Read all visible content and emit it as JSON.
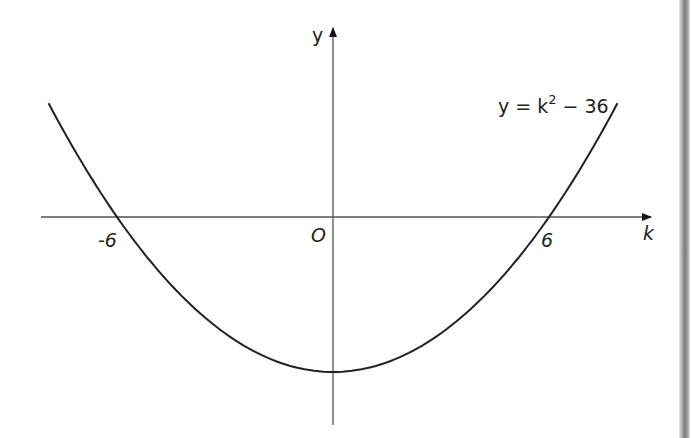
{
  "chart_data": {
    "type": "line",
    "title": "",
    "equation_label": "y = k² − 36",
    "equation_parts": {
      "lhs": "y = k",
      "exp": "2",
      "rhs": " − 36"
    },
    "xlabel": "k",
    "ylabel": "y",
    "origin_label": "O",
    "x_tick_labels": [
      "-6",
      "6"
    ],
    "x_ticks": [
      -6,
      6
    ],
    "vertex": {
      "x": 0,
      "y": -36
    },
    "roots": [
      -6,
      6
    ],
    "xlim": [
      -8.1,
      8.7
    ],
    "ylim": [
      -48,
      44
    ],
    "grid": false,
    "legend": "none",
    "series": [
      {
        "name": "y = k^2 - 36",
        "x": [
          -7.9,
          -7,
          -6,
          -5,
          -4,
          -3,
          -2,
          -1,
          0,
          1,
          2,
          3,
          4,
          5,
          6,
          7,
          7.9
        ],
        "values": [
          26.4,
          13,
          0,
          -11,
          -20,
          -27,
          -32,
          -35,
          -36,
          -35,
          -32,
          -27,
          -20,
          -11,
          0,
          13,
          26.4
        ]
      }
    ],
    "curve_color": "#222222",
    "axis_color": "#555555"
  }
}
